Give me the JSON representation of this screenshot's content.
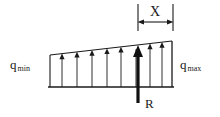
{
  "diagram": {
    "type": "engineering-free-body-diagram",
    "background_color": "#ffffff",
    "line_color": "#1a1a1a",
    "labels": {
      "q_min_symbol": "q",
      "q_min_subscript": "min",
      "q_max_symbol": "q",
      "q_max_subscript": "max",
      "x_dimension": "X",
      "resultant": "R"
    },
    "geometry": {
      "baseline_y": 87,
      "left_edge_x": 50,
      "right_edge_x": 172,
      "top_left_y": 55,
      "top_right_y": 41,
      "resultant_x": 138,
      "resultant_tip_y": 46,
      "resultant_tail_y": 103,
      "dimension_line_y": 22,
      "dimension_left_x": 138,
      "dimension_right_x": 173,
      "extension_top_y": 4,
      "extension_bottom_y": 31
    },
    "load_arrows": {
      "count": 8,
      "x_positions": [
        62,
        77,
        92,
        107,
        121,
        136,
        150,
        162
      ],
      "description": "thin upward pressure arrows from baseline to sloped top edge"
    }
  }
}
